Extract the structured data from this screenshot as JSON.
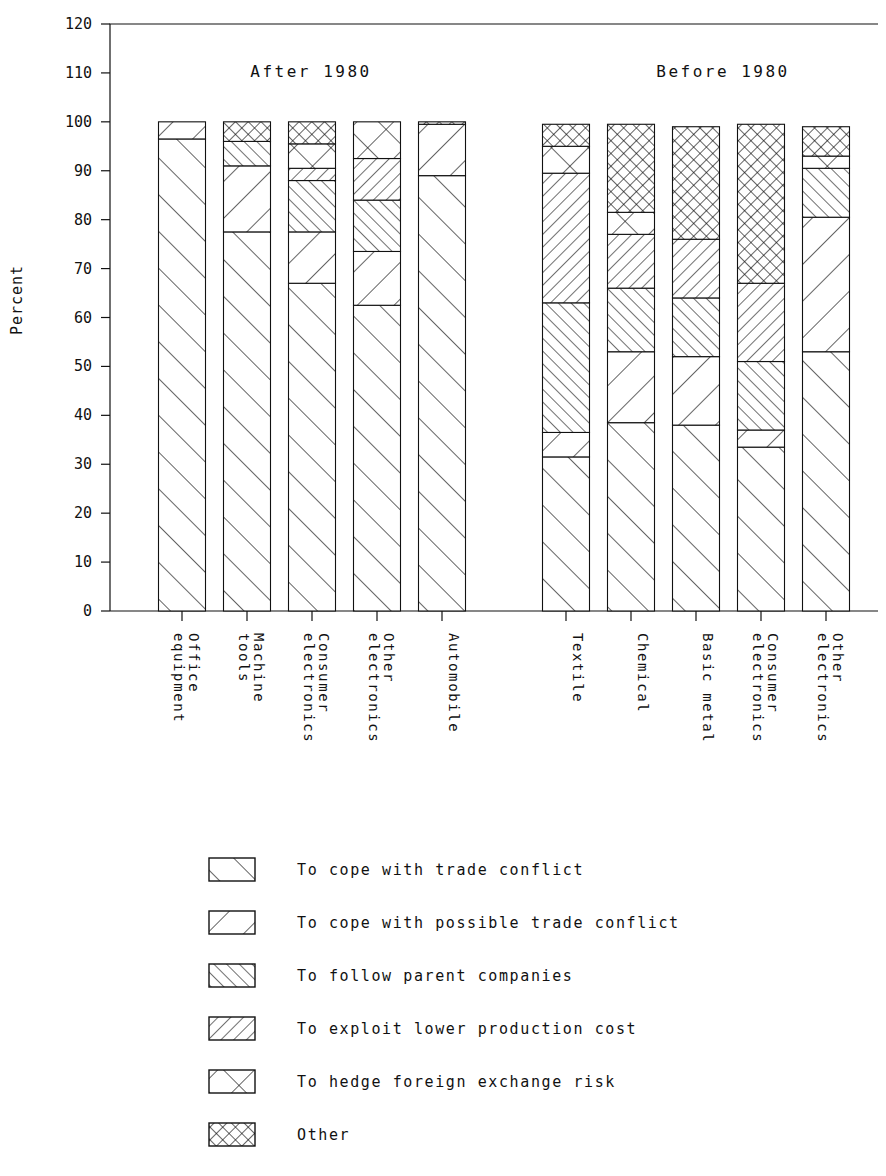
{
  "chart_data": {
    "type": "bar",
    "subtype": "stacked-bar-100",
    "title": "",
    "xlabel": "",
    "ylabel": "Percent",
    "ylim": [
      0,
      120
    ],
    "ytick_labels": [
      "0",
      "10",
      "20",
      "30",
      "40",
      "50",
      "60",
      "70",
      "80",
      "90",
      "100",
      "110",
      "120"
    ],
    "ytick_values": [
      0,
      10,
      20,
      30,
      40,
      50,
      60,
      70,
      80,
      90,
      100,
      110,
      120
    ],
    "grid": false,
    "legend_position": "bottom",
    "group_titles": [
      "After 1980",
      "Before 1980"
    ],
    "series": [
      {
        "name": "To cope with trade conflict",
        "pattern": "hatch-fwd-wide",
        "values": [
          96.5,
          77.5,
          67.0,
          62.5,
          89.0,
          31.5,
          38.5,
          38.0,
          33.5,
          53.0
        ]
      },
      {
        "name": "To cope with possible trade conflict",
        "pattern": "hatch-back-wide",
        "values": [
          3.5,
          13.5,
          10.5,
          11.0,
          10.5,
          5.0,
          14.5,
          14.0,
          3.5,
          27.5
        ]
      },
      {
        "name": "To follow parent companies",
        "pattern": "hatch-fwd-dense",
        "values": [
          0.0,
          5.0,
          10.5,
          10.5,
          0.0,
          26.5,
          13.0,
          12.0,
          14.0,
          10.0
        ]
      },
      {
        "name": "To exploit lower production cost",
        "pattern": "hatch-back-dense",
        "values": [
          0.0,
          0.0,
          2.5,
          8.5,
          0.0,
          26.5,
          11.0,
          12.0,
          16.0,
          0.0
        ]
      },
      {
        "name": "To hedge foreign exchange risk",
        "pattern": "cross-wide",
        "values": [
          0.0,
          0.0,
          5.0,
          7.5,
          0.0,
          5.5,
          4.5,
          0.0,
          0.0,
          2.5
        ]
      },
      {
        "name": "Other",
        "pattern": "cross-dense",
        "values": [
          0.0,
          4.0,
          4.5,
          0.0,
          0.5,
          5.0,
          18.0,
          23.0,
          32.5,
          6.0
        ]
      }
    ],
    "groups": [
      {
        "label": "After 1980",
        "categories": [
          "Office equipment",
          "Machine tools",
          "Consumer electronics",
          "Other electronics",
          "Automobile"
        ],
        "bars": [
          {
            "category": "Office equipment",
            "total": 100.0,
            "boundaries": [
              96.5,
              100.0,
              100.0,
              100.0,
              100.0,
              100.0
            ]
          },
          {
            "category": "Machine tools",
            "total": 100.0,
            "boundaries": [
              77.5,
              91.0,
              96.0,
              96.0,
              96.0,
              100.0
            ]
          },
          {
            "category": "Consumer electronics",
            "total": 100.0,
            "boundaries": [
              67.0,
              77.5,
              88.0,
              90.5,
              95.5,
              100.0
            ]
          },
          {
            "category": "Other electronics",
            "total": 100.0,
            "boundaries": [
              62.5,
              73.5,
              84.0,
              92.5,
              100.0,
              100.0
            ]
          },
          {
            "category": "Automobile",
            "total": 100.0,
            "boundaries": [
              89.0,
              99.5,
              99.5,
              99.5,
              99.5,
              100.0
            ]
          }
        ]
      },
      {
        "label": "Before 1980",
        "categories": [
          "Textile",
          "Chemical",
          "Basic metal",
          "Consumer electronics",
          "Other electronics"
        ],
        "bars": [
          {
            "category": "Textile",
            "total": 99.5,
            "boundaries": [
              31.5,
              36.5,
              63.0,
              89.5,
              95.0,
              99.5
            ]
          },
          {
            "category": "Chemical",
            "total": 99.5,
            "boundaries": [
              38.5,
              53.0,
              66.0,
              77.0,
              81.5,
              99.5
            ]
          },
          {
            "category": "Basic metal",
            "total": 99.0,
            "boundaries": [
              38.0,
              52.0,
              64.0,
              76.0,
              76.0,
              99.0
            ]
          },
          {
            "category": "Consumer electronics",
            "total": 99.5,
            "boundaries": [
              33.5,
              37.0,
              51.0,
              67.0,
              67.0,
              99.5
            ]
          },
          {
            "category": "Other electronics",
            "total": 99.0,
            "boundaries": [
              53.0,
              80.5,
              90.5,
              90.5,
              93.0,
              99.0
            ]
          }
        ]
      }
    ],
    "legend": [
      {
        "label": "To cope with trade conflict",
        "pattern": "hatch-fwd-wide"
      },
      {
        "label": "To cope with possible trade conflict",
        "pattern": "hatch-back-wide"
      },
      {
        "label": "To follow parent companies",
        "pattern": "hatch-fwd-dense"
      },
      {
        "label": "To exploit lower production cost",
        "pattern": "hatch-back-dense"
      },
      {
        "label": "To hedge foreign exchange risk",
        "pattern": "cross-wide"
      },
      {
        "label": "Other",
        "pattern": "cross-dense"
      }
    ],
    "colors": {
      "ink": "#111111",
      "background": "#ffffff"
    }
  },
  "axis": {
    "y_title": "Percent"
  }
}
